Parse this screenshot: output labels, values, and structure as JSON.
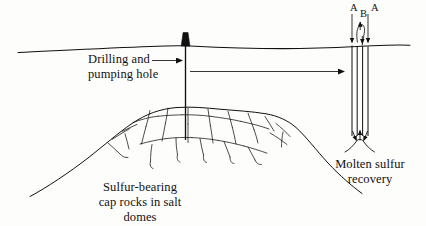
{
  "figure": {
    "domain": "diagram",
    "background_color": "#fdfdfc",
    "ink_color": "#111111",
    "width": 426,
    "height": 226
  },
  "labels": {
    "drilling_line1": "Drilling and",
    "drilling_line2": "pumping hole",
    "caprock_line1": "Sulfur-bearing",
    "caprock_line2": "cap rocks in salt",
    "caprock_line3": "domes",
    "molten_line1": "Molten sulfur",
    "molten_line2": "recovery"
  },
  "well_pipes": {
    "a_left": "A",
    "b_middle": "B",
    "a_right": "A",
    "pipe_count": 4,
    "a_flow_direction": "down",
    "b_flow_direction": "up"
  },
  "geometry": {
    "ground_line_y": 48,
    "drill_rig_x": 185,
    "well_center_x": 360,
    "dome_peak_y": 108,
    "pipe_bottom_y": 142
  }
}
